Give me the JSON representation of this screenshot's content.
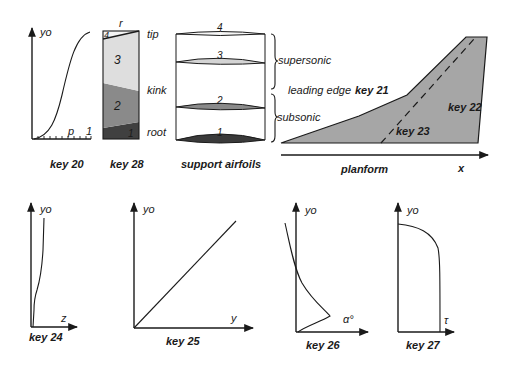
{
  "colors": {
    "ink": "#1a1a1a",
    "planform_fill": "#a6a6a6",
    "region_1": "#404040",
    "region_2": "#8a8a8a",
    "region_3": "#dedede",
    "region_4": "#f4f4f4",
    "airfoil_1": "#3a3a3a",
    "airfoil_2": "#8a8a8a",
    "airfoil_3": "#d4d4d4",
    "airfoil_4": "#f6f6f6"
  },
  "key20": {
    "y_label": "yo",
    "x_label": "p",
    "x_end_tick": "1",
    "caption": "key 20"
  },
  "key28": {
    "top_label": "r",
    "regions": [
      "1",
      "2",
      "3",
      "4"
    ],
    "side_labels": {
      "tip": "tip",
      "kink": "kink",
      "root": "root"
    },
    "caption": "key 28"
  },
  "support_airfoils": {
    "airfoils": [
      "1",
      "2",
      "3",
      "4"
    ],
    "brace_labels": {
      "upper": "supersonic",
      "lower": "subsonic"
    },
    "caption": "support airfoils"
  },
  "planform": {
    "leading_edge_label": "leading edge",
    "keys": {
      "leading_edge": "key 21",
      "trailing_edge": "key 22",
      "dashed_line": "key 23"
    },
    "x_label": "x",
    "caption": "planform"
  },
  "key24": {
    "y_label": "yo",
    "x_label": "z",
    "caption": "key 24"
  },
  "key25": {
    "y_label": "yo",
    "x_label": "y",
    "caption": "key 25"
  },
  "key26": {
    "y_label": "yo",
    "x_label": "α°",
    "caption": "key 26"
  },
  "key27": {
    "y_label": "yo",
    "x_label": "τ",
    "caption": "key 27"
  }
}
